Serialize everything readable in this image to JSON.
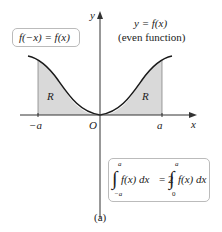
{
  "figure": {
    "caption": "(a)",
    "curve_label": "y = f(x)",
    "curve_note": "(even function)",
    "symmetry_identity": "f(−x) = f(x)",
    "region_label": "R",
    "axis_labels": {
      "x": "x",
      "y": "y"
    },
    "tick_labels": {
      "neg_a": "−a",
      "origin": "O",
      "pos_a": "a"
    },
    "integral_identity": {
      "lhs_upper": "a",
      "lhs_lower": "−a",
      "lhs_integrand": "f(x) dx",
      "equals": "= 2",
      "rhs_upper": "a",
      "rhs_lower": "0",
      "rhs_integrand": "f(x) dx"
    },
    "colors": {
      "shade": "#d9d9d9",
      "curve": "#1a1a1a",
      "axis": "#333333",
      "box_border": "#bbbbbb"
    }
  }
}
